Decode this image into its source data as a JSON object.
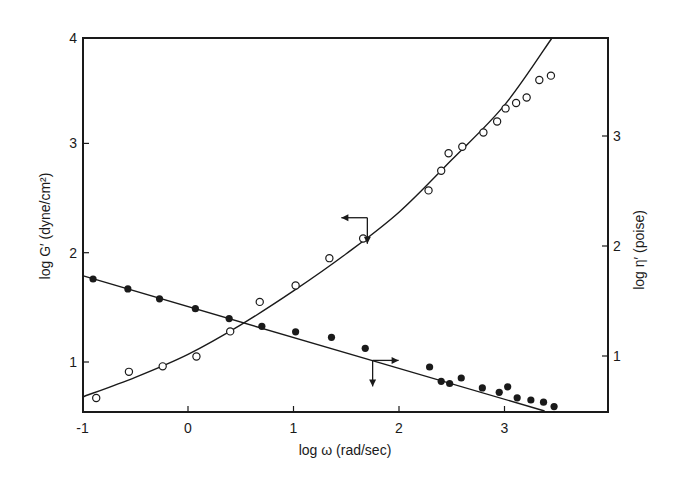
{
  "chart_data": {
    "type": "scatter",
    "title": "",
    "xlabel": "log ω (rad/sec)",
    "ylabel_left": "log G′ (dyne/cm²)",
    "ylabel_right": "log η′ (poise)",
    "xlim": [
      -1.0,
      3.57
    ],
    "ylim_left": [
      0.55,
      4.0
    ],
    "ylim_right": [
      0.5,
      3.97
    ],
    "x_ticks": [
      -1,
      0,
      1,
      2,
      3
    ],
    "x_tick_labels": [
      "-1",
      "0",
      "1",
      "2",
      "3"
    ],
    "y_left_ticks": [
      1,
      2,
      3,
      4
    ],
    "y_left_tick_labels": [
      "1",
      "2",
      "3",
      "4"
    ],
    "y_right_ticks": [
      1,
      2,
      3
    ],
    "y_right_tick_labels": [
      "1",
      "2",
      "3"
    ],
    "grid": false,
    "legend": "none (arrows indicate axis for each series)",
    "series": [
      {
        "name": "log G′",
        "axis": "left",
        "marker": "open-circle",
        "x": [
          -0.87,
          -0.56,
          -0.24,
          0.08,
          0.4,
          0.68,
          1.02,
          1.34,
          1.66,
          2.28,
          2.4,
          2.47,
          2.6,
          2.8,
          2.93,
          3.01,
          3.11,
          3.21,
          3.33,
          3.44
        ],
        "y": [
          0.67,
          0.91,
          0.96,
          1.05,
          1.28,
          1.55,
          1.7,
          1.95,
          2.13,
          2.57,
          2.75,
          2.91,
          2.97,
          3.1,
          3.2,
          3.32,
          3.37,
          3.42,
          3.58,
          3.62
        ],
        "fit_curve": {
          "x": [
            -1.0,
            -0.5,
            0.0,
            0.5,
            1.0,
            1.5,
            2.0,
            2.5,
            3.0,
            3.45
          ],
          "y": [
            0.68,
            0.86,
            1.07,
            1.34,
            1.65,
            1.99,
            2.37,
            2.85,
            3.35,
            4.0
          ]
        },
        "arrow": {
          "x": 1.7,
          "y": 2.32,
          "directions": [
            "left",
            "down"
          ]
        }
      },
      {
        "name": "log η′",
        "axis": "right",
        "marker": "filled-circle",
        "x": [
          -0.9,
          -0.57,
          -0.27,
          0.07,
          0.39,
          0.7,
          1.02,
          1.36,
          1.68,
          2.29,
          2.4,
          2.48,
          2.59,
          2.79,
          2.95,
          3.03,
          3.12,
          3.25,
          3.37,
          3.47
        ],
        "y": [
          1.7,
          1.61,
          1.52,
          1.43,
          1.34,
          1.27,
          1.22,
          1.17,
          1.07,
          0.9,
          0.77,
          0.75,
          0.8,
          0.71,
          0.67,
          0.72,
          0.62,
          0.6,
          0.58,
          0.54
        ],
        "fit_line": {
          "x": [
            -1.0,
            3.38
          ],
          "y": [
            1.73,
            0.5
          ]
        },
        "arrow": {
          "x": 1.75,
          "y": 0.96,
          "directions": [
            "right",
            "down"
          ]
        }
      }
    ]
  }
}
